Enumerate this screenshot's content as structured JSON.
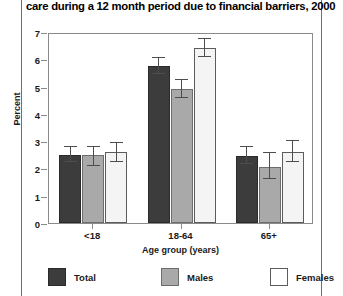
{
  "title": "care during a 12 month period due to financial barriers, 2000",
  "chart_data": {
    "type": "bar",
    "title": "care during a 12 month period due to financial barriers, 2000",
    "xlabel": "Age group (years)",
    "ylabel": "Percent",
    "ylim": [
      0,
      7
    ],
    "yticks": [
      0,
      1,
      2,
      3,
      4,
      5,
      6,
      7
    ],
    "grid": false,
    "legend_position": "bottom",
    "categories": [
      "<18",
      "18-64",
      "65+"
    ],
    "series": [
      {
        "name": "Total",
        "color": "#3c3c3c",
        "values": [
          2.5,
          5.75,
          2.45
        ],
        "err_low": [
          2.25,
          5.45,
          2.15
        ],
        "err_high": [
          2.8,
          6.05,
          2.8
        ]
      },
      {
        "name": "Males",
        "color": "#a9a9a9",
        "values": [
          2.5,
          4.9,
          2.05
        ],
        "err_low": [
          2.1,
          4.6,
          1.6
        ],
        "err_high": [
          2.8,
          5.25,
          2.55
        ]
      },
      {
        "name": "Females",
        "color": "#f4f4f4",
        "values": [
          2.6,
          6.4,
          2.6
        ],
        "err_low": [
          2.25,
          6.1,
          2.25
        ],
        "err_high": [
          2.95,
          6.75,
          3.0
        ]
      }
    ]
  }
}
